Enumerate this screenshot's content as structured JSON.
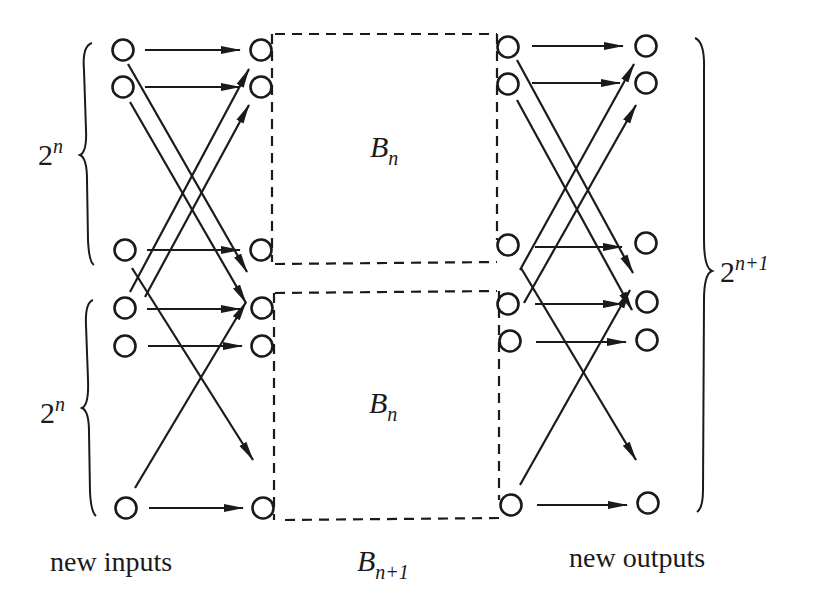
{
  "diagram": {
    "block_top_label": {
      "base": "B",
      "sub": "n"
    },
    "block_bottom_label": {
      "base": "B",
      "sub": "n"
    },
    "outer_label": {
      "base": "B",
      "sub": "n+1"
    },
    "left_brace_top": {
      "base": "2",
      "sup": "n"
    },
    "left_brace_bottom": {
      "base": "2",
      "sup": "n"
    },
    "right_brace": {
      "base": "2",
      "sup": "n+1"
    },
    "caption_left": "new inputs",
    "caption_right": "new outputs",
    "columns": {
      "new_inputs_x": 125,
      "block_inputs_x": 262,
      "block_outputs_x": 508,
      "new_outputs_x": 645
    },
    "rows_left": [
      50,
      87,
      250,
      307,
      345,
      508
    ],
    "rows_right": [
      47,
      83,
      245,
      303,
      340,
      503
    ],
    "colors": {
      "stroke": "#1a1a1a",
      "background": "#ffffff"
    }
  }
}
